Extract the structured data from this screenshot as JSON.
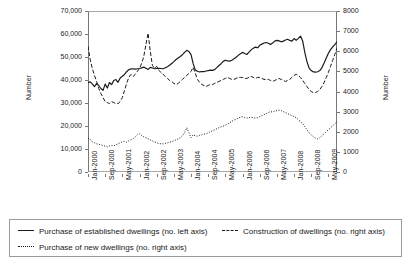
{
  "chart_data": {
    "type": "line",
    "title": "",
    "xlabel": "",
    "ylabel": "Number",
    "ylabel_right": "Number",
    "ylim": [
      0,
      70000
    ],
    "ylim_right": [
      0,
      8000
    ],
    "grid": false,
    "legend_position": "bottom",
    "y_ticks_left": [
      "0",
      "10,000",
      "20,000",
      "30,000",
      "40,000",
      "50,000",
      "60,000",
      "70,000"
    ],
    "y_ticks_left_values": [
      0,
      10000,
      20000,
      30000,
      40000,
      50000,
      60000,
      70000
    ],
    "y_ticks_right": [
      "0",
      "1000",
      "2000",
      "3000",
      "4000",
      "5000",
      "6000",
      "7000",
      "8000"
    ],
    "y_ticks_right_values": [
      0,
      1000,
      2000,
      3000,
      4000,
      5000,
      6000,
      7000,
      8000
    ],
    "x_tick_labels": [
      "Jan-2000",
      "Sep-2000",
      "May-2001",
      "Jan-2002",
      "Sep-2002",
      "May-2003",
      "Jan-2004",
      "Sep-2004",
      "May-2005",
      "Jan-2006",
      "Sep-2006",
      "May-2007",
      "Jan-2008",
      "Sep-2008",
      "May-2009"
    ],
    "x_tick_indices": [
      0,
      8,
      16,
      24,
      32,
      40,
      48,
      56,
      64,
      72,
      80,
      88,
      96,
      104,
      112
    ],
    "x_start": "Jan-2000",
    "x_end": "Sep-2009",
    "n_points": 117,
    "series": [
      {
        "name": "Purchase of established dwellings (no. left axis)",
        "axis": "left",
        "style": "solid",
        "color": "#1a1a1a",
        "values": [
          38800,
          39200,
          38300,
          37100,
          38400,
          37600,
          36300,
          35500,
          38200,
          36500,
          38900,
          38000,
          39800,
          40200,
          39000,
          40900,
          41600,
          42400,
          43600,
          44500,
          44800,
          44900,
          44700,
          44900,
          45000,
          45300,
          45600,
          45100,
          44600,
          45500,
          45200,
          44900,
          45000,
          45100,
          45000,
          44900,
          45300,
          45800,
          46400,
          47200,
          48000,
          48900,
          49600,
          50200,
          51000,
          52000,
          52900,
          52400,
          51000,
          47100,
          44300,
          43800,
          43500,
          43700,
          43600,
          43900,
          44100,
          44300,
          44200,
          44500,
          45400,
          46300,
          47100,
          48100,
          48600,
          48300,
          48200,
          48600,
          49200,
          49900,
          50700,
          51400,
          52000,
          51500,
          51100,
          52100,
          53100,
          53800,
          54300,
          54000,
          55100,
          55600,
          56100,
          56300,
          56000,
          55400,
          56100,
          56900,
          57200,
          57000,
          56600,
          56900,
          57400,
          57700,
          57200,
          56900,
          58000,
          57300,
          58100,
          59100,
          57000,
          52000,
          48000,
          45200,
          44100,
          43500,
          43400,
          43600,
          44100,
          45400,
          47400,
          49600,
          51600,
          53200,
          54400,
          55400,
          56600,
          56000,
          55200,
          55800,
          56500
        ]
      },
      {
        "name": "Construction of dwellings (no. right axis)",
        "axis": "right",
        "style": "dashed",
        "color": "#1a1a1a",
        "values": [
          6250,
          5600,
          5150,
          4800,
          4500,
          4150,
          3900,
          3700,
          3500,
          3450,
          3400,
          3500,
          3450,
          3400,
          3400,
          3500,
          3700,
          4050,
          4400,
          4700,
          4850,
          4750,
          4850,
          5000,
          5150,
          5400,
          5750,
          6350,
          6900,
          6000,
          5300,
          5150,
          5250,
          5050,
          4950,
          4850,
          4750,
          4650,
          4550,
          4500,
          4400,
          4350,
          4400,
          4500,
          4600,
          4700,
          4800,
          4900,
          5000,
          5200,
          4900,
          4600,
          4450,
          4350,
          4300,
          4250,
          4300,
          4350,
          4350,
          4400,
          4450,
          4500,
          4550,
          4600,
          4650,
          4700,
          4650,
          4600,
          4600,
          4650,
          4700,
          4700,
          4700,
          4650,
          4650,
          4700,
          4750,
          4700,
          4650,
          4700,
          4700,
          4650,
          4600,
          4600,
          4600,
          4550,
          4500,
          4550,
          4600,
          4650,
          4600,
          4550,
          4500,
          4550,
          4600,
          4700,
          4800,
          4850,
          4800,
          4700,
          4550,
          4400,
          4250,
          4100,
          4000,
          3950,
          3950,
          4000,
          4100,
          4250,
          4450,
          4700,
          4950,
          5250,
          5550,
          5850,
          6150,
          6350,
          6500,
          6400,
          6250
        ]
      },
      {
        "name": "Purchase of new dwellings (no. right axis)",
        "axis": "right",
        "style": "dotted",
        "color": "#1a1a1a",
        "values": [
          1680,
          1620,
          1500,
          1450,
          1400,
          1380,
          1350,
          1320,
          1280,
          1250,
          1300,
          1320,
          1300,
          1350,
          1400,
          1450,
          1500,
          1520,
          1480,
          1550,
          1600,
          1650,
          1750,
          1850,
          1900,
          1820,
          1750,
          1700,
          1650,
          1600,
          1550,
          1500,
          1450,
          1420,
          1400,
          1400,
          1420,
          1450,
          1480,
          1500,
          1550,
          1600,
          1650,
          1700,
          1800,
          1950,
          2200,
          1950,
          1700,
          1850,
          1800,
          1780,
          1820,
          1850,
          1880,
          1900,
          1950,
          2000,
          2050,
          2100,
          2150,
          2200,
          2250,
          2280,
          2320,
          2380,
          2450,
          2520,
          2580,
          2620,
          2680,
          2720,
          2750,
          2700,
          2680,
          2700,
          2720,
          2700,
          2680,
          2700,
          2750,
          2800,
          2850,
          2900,
          2950,
          3000,
          2980,
          3020,
          3050,
          3080,
          3050,
          3000,
          2950,
          2900,
          2850,
          2800,
          2750,
          2700,
          2600,
          2500,
          2400,
          2250,
          2100,
          1950,
          1850,
          1750,
          1680,
          1650,
          1700,
          1800,
          1900,
          2000,
          2100,
          2200,
          2300,
          2400,
          2500,
          2600,
          2680,
          2720,
          2750
        ]
      }
    ]
  },
  "legend": {
    "items": [
      {
        "label": "Purchase of established dwellings (no. left axis)",
        "style": "solid"
      },
      {
        "label": "Construction of dwellings (no. right axis)",
        "style": "dashed"
      },
      {
        "label": "Purchase of new dwellings (no. right axis)",
        "style": "dotted"
      }
    ]
  },
  "axes": {
    "left_title": "Number",
    "right_title": "Number"
  }
}
